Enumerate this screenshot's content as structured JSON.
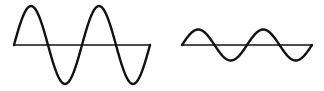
{
  "figure": {
    "stroke_color": "#111111",
    "background": "#ffffff",
    "waves": [
      {
        "name": "high-amplitude-wave",
        "axis_y": 45,
        "x_start": 14,
        "x_end": 150,
        "amplitude": 39,
        "cycles": 2
      },
      {
        "name": "low-amplitude-wave",
        "axis_y": 45,
        "x_start": 182,
        "x_end": 312,
        "amplitude": 15.5,
        "cycles": 2
      }
    ]
  }
}
